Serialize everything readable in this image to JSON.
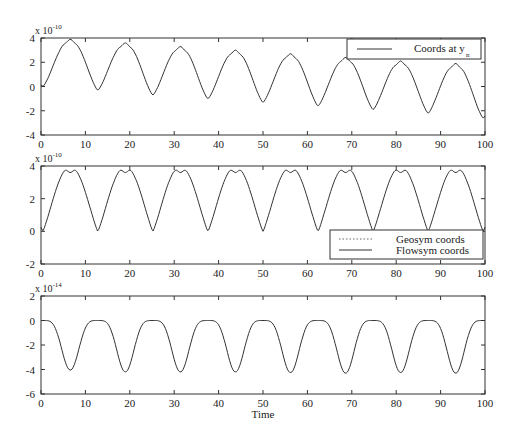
{
  "chart_data": [
    {
      "type": "line",
      "panel": "top",
      "title": "",
      "xlabel": "",
      "ylabel": "",
      "y_multiplier": "x 10^-10",
      "y_multiplier_base": "x 10",
      "y_multiplier_exp": "-10",
      "xlim": [
        0,
        100
      ],
      "ylim": [
        -4,
        4
      ],
      "xticks": [
        0,
        10,
        20,
        30,
        40,
        50,
        60,
        70,
        80,
        90,
        100
      ],
      "yticks": [
        -4,
        -2,
        0,
        2,
        4
      ],
      "grid": false,
      "legend": {
        "position": "upper right",
        "entries": [
          {
            "label": "Coords at y",
            "subscript": "n",
            "style": "solid"
          }
        ]
      },
      "series": [
        {
          "name": "Coords at y_n",
          "style": "solid",
          "description": "Oscillation with period ~12.4, double-humped peaks with slowly decreasing maxima and troughs",
          "peak_times": [
            5.2,
            17.6,
            30.0,
            42.4,
            54.8,
            67.2,
            79.6,
            92.0
          ],
          "peak_values": [
            3.9,
            3.6,
            3.3,
            3.0,
            2.7,
            2.4,
            2.1,
            1.9
          ],
          "trough_times": [
            12.8,
            25.2,
            37.6,
            50.0,
            62.4,
            74.8,
            87.2,
            99.6
          ],
          "trough_values": [
            -0.3,
            -0.7,
            -1.0,
            -1.3,
            -1.6,
            -1.9,
            -2.2,
            -2.6
          ],
          "start_value": 0
        }
      ]
    },
    {
      "type": "line",
      "panel": "middle",
      "title": "",
      "xlabel": "",
      "ylabel": "",
      "y_multiplier": "x 10^-10",
      "y_multiplier_base": "x 10",
      "y_multiplier_exp": "-10",
      "xlim": [
        0,
        100
      ],
      "ylim": [
        -2,
        4
      ],
      "xticks": [
        0,
        10,
        20,
        30,
        40,
        50,
        60,
        70,
        80,
        90,
        100
      ],
      "yticks": [
        -2,
        0,
        2,
        4
      ],
      "grid": false,
      "legend": {
        "position": "lower right",
        "entries": [
          {
            "label": "Geosym coords",
            "style": "dotted"
          },
          {
            "label": "Flowsym coords",
            "style": "solid"
          }
        ]
      },
      "series": [
        {
          "name": "Geosym coords",
          "style": "dotted",
          "description": "Overlaps Flowsym coords"
        },
        {
          "name": "Flowsym coords",
          "style": "solid",
          "description": "Periodic oscillation, period ~12.4, between 0 and 4 with double-humped peaks (dip to ~3.6)",
          "peak_value": 4.0,
          "peak_dip_value": 3.6,
          "trough_value": 0.0,
          "trough_times": [
            0,
            12.8,
            25.2,
            37.6,
            50.0,
            62.4,
            74.8,
            87.2,
            99.6
          ]
        }
      ]
    },
    {
      "type": "line",
      "panel": "bottom",
      "title": "",
      "xlabel": "Time",
      "ylabel": "",
      "y_multiplier": "x 10^-14",
      "y_multiplier_base": "x 10",
      "y_multiplier_exp": "-14",
      "xlim": [
        0,
        100
      ],
      "ylim": [
        -6,
        2
      ],
      "xticks": [
        0,
        10,
        20,
        30,
        40,
        50,
        60,
        70,
        80,
        90,
        100
      ],
      "yticks": [
        -6,
        -4,
        -2,
        0,
        2
      ],
      "grid": false,
      "series": [
        {
          "name": "difference",
          "style": "solid",
          "description": "Periodic oscillation between ~0 and ~-4.2, period ~12.4",
          "max_value": 0.0,
          "trough_times": [
            6.6,
            19.0,
            31.4,
            43.8,
            56.2,
            68.6,
            81.0,
            93.4
          ],
          "trough_values": [
            -4.05,
            -4.2,
            -4.2,
            -4.2,
            -4.25,
            -4.3,
            -4.25,
            -4.3
          ]
        }
      ]
    }
  ],
  "labels": {
    "xlabel": "Time",
    "legend_top": "Coords at y",
    "legend_top_sub": "n",
    "legend_mid_1": "Geosym coords",
    "legend_mid_2": "Flowsym coords",
    "exp_base": "x 10",
    "exp_top": "-10",
    "exp_mid": "-10",
    "exp_bot": "-14"
  }
}
